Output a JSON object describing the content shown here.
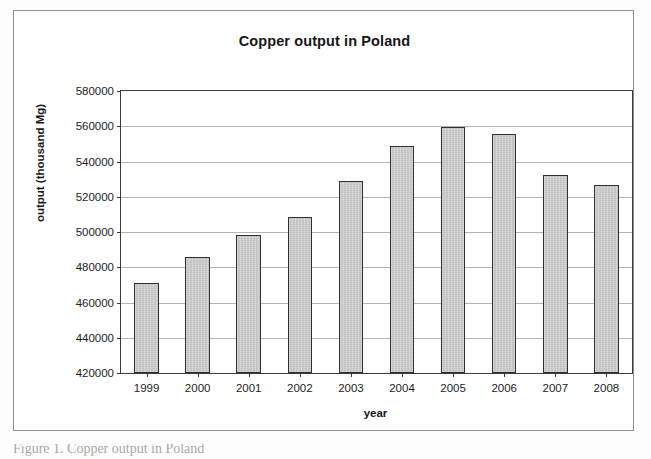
{
  "figure": {
    "caption_clipped": "Figure 1. Copper output in Poland"
  },
  "chart_data": {
    "type": "bar",
    "title": "Copper output in Poland",
    "xlabel": "year",
    "ylabel": "output (thousand Mg)",
    "categories": [
      "1999",
      "2000",
      "2001",
      "2002",
      "2003",
      "2004",
      "2005",
      "2006",
      "2007",
      "2008"
    ],
    "values": [
      471000,
      486000,
      498500,
      508500,
      529000,
      549000,
      559500,
      555500,
      532500,
      526500
    ],
    "ylim": [
      420000,
      580000
    ],
    "ytick_step": 20000,
    "yticks": [
      420000,
      440000,
      460000,
      480000,
      500000,
      520000,
      540000,
      560000,
      580000
    ],
    "ytick_labels": [
      "420000",
      "440000",
      "460000",
      "480000",
      "500000",
      "520000",
      "540000",
      "560000",
      "580000"
    ],
    "grid": true,
    "grid_axis": "y",
    "legend": false,
    "series": [
      {
        "name": "output",
        "values": [
          471000,
          486000,
          498500,
          508500,
          529000,
          549000,
          559500,
          555500,
          532500,
          526500
        ]
      }
    ],
    "colors": {
      "bar_fill": "#c9c9c9",
      "bar_border": "#2f2f2f",
      "gridline": "#b4b4b4",
      "axis": "#3a3a3a",
      "text": "#161616",
      "plot_background": "#ffffff",
      "frame_border": "#8e8e8e"
    }
  }
}
